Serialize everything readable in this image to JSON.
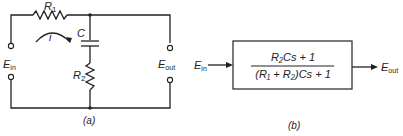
{
  "circuit": {
    "r1_label": "R",
    "r1_sub": "1",
    "r2_label": "R",
    "r2_sub": "2",
    "c_label": "C",
    "current_label": "i",
    "ein_label": "E",
    "ein_sub": "in",
    "eout_label": "E",
    "eout_sub": "out",
    "caption": "(a)"
  },
  "block": {
    "numerator": "R₂Cs + 1",
    "denominator": "(R₁ + R₂)Cs + 1",
    "input_label": "E",
    "input_sub": "in",
    "output_label": "E",
    "output_sub": "out",
    "caption": "(b)"
  }
}
